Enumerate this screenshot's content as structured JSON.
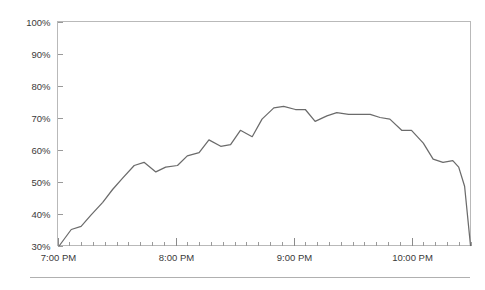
{
  "page": {
    "background_color": "#ffffff",
    "footer_rule_color": "#b0b0b0"
  },
  "chart_data": {
    "type": "line",
    "title": "",
    "subtitle": "",
    "xlabel": "",
    "ylabel": "",
    "grid": false,
    "legend": false,
    "legend_position": "none",
    "line_color": "#6b6b6b",
    "axis_color": "#b9b9b9",
    "tick_label_color": "#3a3a3a",
    "xlim": [
      "7:00 PM",
      "10:30 PM"
    ],
    "ylim": [
      30,
      100
    ],
    "y_unit": "%",
    "y_ticks": [
      30,
      40,
      50,
      60,
      70,
      80,
      90,
      100
    ],
    "y_tick_labels": [
      "30%",
      "40%",
      "50%",
      "60%",
      "70%",
      "80%",
      "90%",
      "100%"
    ],
    "x_major_ticks": [
      "7:00 PM",
      "8:00 PM",
      "9:00 PM",
      "10:00 PM"
    ],
    "x_major_tick_labels": [
      "7:00 PM",
      "8:00 PM",
      "9:00 PM",
      "10:00 PM"
    ],
    "x_minor_tick_interval_minutes": 6,
    "x_axis_start_minutes": 1140,
    "x_axis_end_minutes": 1350,
    "series": [
      {
        "name": "Percent",
        "color": "#6b6b6b",
        "x": [
          1141,
          1147,
          1152,
          1157,
          1163,
          1168,
          1173,
          1179,
          1184,
          1190,
          1195,
          1201,
          1206,
          1212,
          1217,
          1223,
          1228,
          1233,
          1239,
          1244,
          1250,
          1255,
          1261,
          1266,
          1271,
          1277,
          1282,
          1288,
          1293,
          1299,
          1304,
          1309,
          1315,
          1320,
          1326,
          1331,
          1336,
          1341,
          1344,
          1347,
          1350
        ],
        "x_labels": [
          "7:00 PM",
          "7:07 PM",
          "7:12 PM",
          "7:17 PM",
          "7:23 PM",
          "7:28 PM",
          "7:33 PM",
          "7:39 PM",
          "7:44 PM",
          "7:50 PM",
          "7:55 PM",
          "8:01 PM",
          "8:06 PM",
          "8:12 PM",
          "8:17 PM",
          "8:23 PM",
          "8:28 PM",
          "8:33 PM",
          "8:39 PM",
          "8:44 PM",
          "8:50 PM",
          "8:55 PM",
          "9:01 PM",
          "9:06 PM",
          "9:11 PM",
          "9:17 PM",
          "9:22 PM",
          "9:28 PM",
          "9:33 PM",
          "9:39 PM",
          "9:44 PM",
          "9:49 PM",
          "9:55 PM",
          "10:00 PM",
          "10:06 PM",
          "10:11 PM",
          "10:16 PM",
          "10:21 PM",
          "10:24 PM",
          "10:27 PM",
          "10:30 PM"
        ],
        "values": [
          30.0,
          35.0,
          36.0,
          39.5,
          43.5,
          47.5,
          51.0,
          55.0,
          56.0,
          53.0,
          54.5,
          55.0,
          58.0,
          59.0,
          63.0,
          61.0,
          61.5,
          66.0,
          64.0,
          69.5,
          73.0,
          73.5,
          72.5,
          72.5,
          68.8,
          70.5,
          71.5,
          71.0,
          71.0,
          71.0,
          70.0,
          69.5,
          66.0,
          66.0,
          62.0,
          57.0,
          56.0,
          56.5,
          54.5,
          48.5,
          30.0
        ]
      }
    ],
    "peak": {
      "label": "73.5%",
      "time": "8:55 PM"
    },
    "minimum": {
      "label": "30%",
      "time": "7:00 PM"
    }
  }
}
